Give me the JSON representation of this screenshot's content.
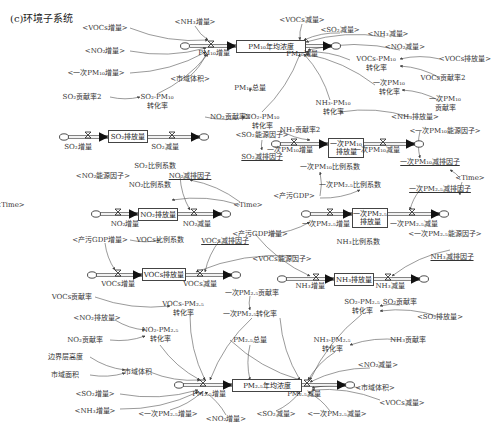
{
  "title": "(c)环境子系统",
  "stocks": [
    {
      "id": "pm10_conc",
      "label": "PM₁₀年均浓度",
      "x": 236,
      "y": 40,
      "w": 70,
      "h": 13
    },
    {
      "id": "so2_emit",
      "label": "SO₂排放量",
      "x": 108,
      "y": 130,
      "w": 40,
      "h": 13
    },
    {
      "id": "pm10_primary",
      "label": "一次PM₁₀\n排放量",
      "x": 328,
      "y": 138,
      "w": 36,
      "h": 20
    },
    {
      "id": "no2_emit",
      "label": "NO₂排放量",
      "x": 138,
      "y": 208,
      "w": 40,
      "h": 13
    },
    {
      "id": "pm25_primary",
      "label": "一次PM₂.₅\n排放量",
      "x": 352,
      "y": 208,
      "w": 36,
      "h": 20
    },
    {
      "id": "vocs_emit",
      "label": "VOCs排放量",
      "x": 142,
      "y": 268,
      "w": 44,
      "h": 13
    },
    {
      "id": "nh3_emit",
      "label": "NH₃排放量",
      "x": 334,
      "y": 273,
      "w": 40,
      "h": 13
    },
    {
      "id": "pm25_conc",
      "label": "PM₂.₅年均浓度",
      "x": 232,
      "y": 379,
      "w": 70,
      "h": 13
    }
  ],
  "labels": [
    {
      "t": "<VOCs增量>",
      "x": 105,
      "y": 28
    },
    {
      "t": "<NH₃增量>",
      "x": 195,
      "y": 22
    },
    {
      "t": "<VOCs减量>",
      "x": 302,
      "y": 20
    },
    {
      "t": "<SO₂减量>",
      "x": 340,
      "y": 30
    },
    {
      "t": "<NH₃减量>",
      "x": 388,
      "y": 34
    },
    {
      "t": "<NO₂增量>",
      "x": 105,
      "y": 51
    },
    {
      "t": "<NO₂减量>",
      "x": 405,
      "y": 47
    },
    {
      "t": "PM₁₀增量",
      "x": 214,
      "y": 53
    },
    {
      "t": "PM₁₀减量",
      "x": 302,
      "y": 54
    },
    {
      "t": "VOCs-PM₁₀",
      "x": 376,
      "y": 59
    },
    {
      "t": "转化率",
      "x": 376,
      "y": 68
    },
    {
      "t": "<VOCs排放量>",
      "x": 465,
      "y": 59
    },
    {
      "t": "VOCs贡献率2",
      "x": 443,
      "y": 78
    },
    {
      "t": "<一次PM₁₀增量>",
      "x": 96,
      "y": 73
    },
    {
      "t": "<市域体积>",
      "x": 190,
      "y": 79
    },
    {
      "t": "PM₁₀总量",
      "x": 250,
      "y": 88
    },
    {
      "t": "一次PM₁₀",
      "x": 389,
      "y": 83
    },
    {
      "t": "转化率",
      "x": 389,
      "y": 92
    },
    {
      "t": "一次PM₁₀",
      "x": 445,
      "y": 99
    },
    {
      "t": "贡献率",
      "x": 445,
      "y": 108
    },
    {
      "t": "SO₂贡献率2",
      "x": 82,
      "y": 97
    },
    {
      "t": "SO₂-PM₁₀",
      "x": 157,
      "y": 97
    },
    {
      "t": "转化率",
      "x": 157,
      "y": 106
    },
    {
      "t": "NH₃-PM₁₀",
      "x": 333,
      "y": 103
    },
    {
      "t": "转化率",
      "x": 333,
      "y": 112
    },
    {
      "t": "NO₂贡献率2",
      "x": 230,
      "y": 117
    },
    {
      "t": "NO₂-PM₁₀",
      "x": 262,
      "y": 117
    },
    {
      "t": "转化率",
      "x": 262,
      "y": 126
    },
    {
      "t": "<NH₃排放量>",
      "x": 415,
      "y": 117
    },
    {
      "t": "NH₃贡献率2",
      "x": 300,
      "y": 130
    },
    {
      "t": "<一次PM₁₀能源因子>",
      "x": 445,
      "y": 131
    },
    {
      "t": "<SO₂能源因子>",
      "x": 262,
      "y": 135
    },
    {
      "t": "SO₂增量",
      "x": 78,
      "y": 147
    },
    {
      "t": "SO₂减量",
      "x": 165,
      "y": 147
    },
    {
      "t": "一次PM₁₀增量",
      "x": 290,
      "y": 150
    },
    {
      "t": "一次PM₁₀减量",
      "x": 377,
      "y": 150
    },
    {
      "t": "SO₂减排因子",
      "x": 262,
      "y": 157,
      "u": true
    },
    {
      "t": "一次PM₁₀减排因子",
      "x": 430,
      "y": 162,
      "u": true
    },
    {
      "t": "SO₂比例系数",
      "x": 155,
      "y": 166
    },
    {
      "t": "一次PM₁₀比例系数",
      "x": 330,
      "y": 167
    },
    {
      "t": "<NO₂能源因子>",
      "x": 103,
      "y": 176
    },
    {
      "t": "NO₂减排因子",
      "x": 190,
      "y": 176,
      "u": true
    },
    {
      "t": "<Time>",
      "x": 470,
      "y": 178
    },
    {
      "t": "NO₂比例系数",
      "x": 150,
      "y": 185
    },
    {
      "t": "一次PM₂.₅比例系数",
      "x": 350,
      "y": 185
    },
    {
      "t": "<产污GDP>",
      "x": 294,
      "y": 196
    },
    {
      "t": "一次PM₂.₅减排因子",
      "x": 440,
      "y": 189,
      "u": true
    },
    {
      "t": "<Time>",
      "x": 248,
      "y": 205
    },
    {
      "t": "<Time>",
      "x": 10,
      "y": 205
    },
    {
      "t": "NO₂增量",
      "x": 125,
      "y": 224
    },
    {
      "t": "NO₂减量",
      "x": 197,
      "y": 224
    },
    {
      "t": "一次PM₂.₅增量",
      "x": 326,
      "y": 224
    },
    {
      "t": "一次PM₂.₅减量",
      "x": 414,
      "y": 224
    },
    {
      "t": "<产污GDP增量>",
      "x": 100,
      "y": 240
    },
    {
      "t": "<产污GDP增量>",
      "x": 260,
      "y": 234
    },
    {
      "t": "VOCs比例系数",
      "x": 160,
      "y": 240
    },
    {
      "t": "VOCs减排因子",
      "x": 225,
      "y": 241,
      "u": true
    },
    {
      "t": "NH₃比例系数",
      "x": 358,
      "y": 242
    },
    {
      "t": "<一次PM₂.₅能源因子>",
      "x": 445,
      "y": 234
    },
    {
      "t": "<VOCs能源因子>",
      "x": 282,
      "y": 259
    },
    {
      "t": "NH₃减排因子",
      "x": 452,
      "y": 257,
      "u": true
    },
    {
      "t": "VOCs增量",
      "x": 118,
      "y": 284
    },
    {
      "t": "VOCs减量",
      "x": 200,
      "y": 284
    },
    {
      "t": "NH₃增量",
      "x": 310,
      "y": 286
    },
    {
      "t": "NH₃减量",
      "x": 390,
      "y": 286
    },
    {
      "t": "VOCs贡献率",
      "x": 72,
      "y": 297
    },
    {
      "t": "一次PM₂.₅贡献率",
      "x": 252,
      "y": 293
    },
    {
      "t": "VOCs-PM₂.₅",
      "x": 183,
      "y": 304
    },
    {
      "t": "转化率",
      "x": 183,
      "y": 313
    },
    {
      "t": "SO₂-PM₂.₅",
      "x": 362,
      "y": 302
    },
    {
      "t": "转化率",
      "x": 362,
      "y": 311
    },
    {
      "t": "SO₂贡献率",
      "x": 400,
      "y": 302
    },
    {
      "t": "一次PM₂.₅转化率",
      "x": 250,
      "y": 314
    },
    {
      "t": "<SO₂排放量>",
      "x": 440,
      "y": 317
    },
    {
      "t": "<NO₂排放量>",
      "x": 97,
      "y": 318
    },
    {
      "t": "NO₂-PM₂.₅",
      "x": 160,
      "y": 330
    },
    {
      "t": "转化率",
      "x": 160,
      "y": 339
    },
    {
      "t": "NO₂贡献率",
      "x": 85,
      "y": 340
    },
    {
      "t": "PM₂.₅总量",
      "x": 250,
      "y": 340
    },
    {
      "t": "NH₃-PM₂.₅",
      "x": 332,
      "y": 340
    },
    {
      "t": "转化率",
      "x": 332,
      "y": 349
    },
    {
      "t": "NH₃贡献率",
      "x": 408,
      "y": 340
    },
    {
      "t": "边界层高度",
      "x": 65,
      "y": 357
    },
    {
      "t": "<NO₂减量>",
      "x": 378,
      "y": 365
    },
    {
      "t": "市域体积",
      "x": 138,
      "y": 372
    },
    {
      "t": "市域面积",
      "x": 65,
      "y": 375
    },
    {
      "t": "PM₂.₅增量",
      "x": 209,
      "y": 394
    },
    {
      "t": "PM₂.₅减量",
      "x": 304,
      "y": 394
    },
    {
      "t": "<市域体积>",
      "x": 375,
      "y": 388
    },
    {
      "t": "<SO₂增量>",
      "x": 95,
      "y": 394
    },
    {
      "t": "<VOCs减量>",
      "x": 402,
      "y": 403
    },
    {
      "t": "<NH₃增量>",
      "x": 95,
      "y": 411
    },
    {
      "t": "<一次PM₂.₅增量>",
      "x": 168,
      "y": 414
    },
    {
      "t": "<NO₂增量>",
      "x": 226,
      "y": 419
    },
    {
      "t": "<SO₂减量>",
      "x": 276,
      "y": 414
    },
    {
      "t": "<一次PM₂.₅减量>",
      "x": 337,
      "y": 414
    }
  ],
  "flows": [
    {
      "x1": 190,
      "y1": 46,
      "x2": 236,
      "y2": 46
    },
    {
      "x1": 306,
      "y1": 46,
      "x2": 332,
      "y2": 46
    },
    {
      "x1": 68,
      "y1": 137,
      "x2": 108,
      "y2": 137
    },
    {
      "x1": 148,
      "y1": 137,
      "x2": 200,
      "y2": 137
    },
    {
      "x1": 280,
      "y1": 144,
      "x2": 328,
      "y2": 144
    },
    {
      "x1": 364,
      "y1": 144,
      "x2": 415,
      "y2": 144
    },
    {
      "x1": 100,
      "y1": 214,
      "x2": 138,
      "y2": 214
    },
    {
      "x1": 178,
      "y1": 214,
      "x2": 222,
      "y2": 214
    },
    {
      "x1": 310,
      "y1": 214,
      "x2": 352,
      "y2": 214
    },
    {
      "x1": 388,
      "y1": 214,
      "x2": 440,
      "y2": 214
    },
    {
      "x1": 96,
      "y1": 275,
      "x2": 142,
      "y2": 275
    },
    {
      "x1": 186,
      "y1": 275,
      "x2": 232,
      "y2": 275
    },
    {
      "x1": 286,
      "y1": 279,
      "x2": 334,
      "y2": 279
    },
    {
      "x1": 374,
      "y1": 279,
      "x2": 420,
      "y2": 279
    },
    {
      "x1": 183,
      "y1": 385,
      "x2": 232,
      "y2": 385
    },
    {
      "x1": 302,
      "y1": 385,
      "x2": 346,
      "y2": 385
    }
  ],
  "valves": [
    {
      "x": 211,
      "y": 46
    },
    {
      "x": 300,
      "y": 46
    },
    {
      "x": 88,
      "y": 137
    },
    {
      "x": 172,
      "y": 137
    },
    {
      "x": 294,
      "y": 144
    },
    {
      "x": 383,
      "y": 144
    },
    {
      "x": 118,
      "y": 214
    },
    {
      "x": 194,
      "y": 214
    },
    {
      "x": 330,
      "y": 214
    },
    {
      "x": 412,
      "y": 214
    },
    {
      "x": 118,
      "y": 275
    },
    {
      "x": 200,
      "y": 275
    },
    {
      "x": 316,
      "y": 279
    },
    {
      "x": 388,
      "y": 279
    },
    {
      "x": 203,
      "y": 385
    },
    {
      "x": 307,
      "y": 385
    }
  ],
  "clouds": [
    {
      "x": 185,
      "y": 46
    },
    {
      "x": 336,
      "y": 46
    },
    {
      "x": 64,
      "y": 137
    },
    {
      "x": 204,
      "y": 137
    },
    {
      "x": 276,
      "y": 144
    },
    {
      "x": 419,
      "y": 144
    },
    {
      "x": 96,
      "y": 214
    },
    {
      "x": 226,
      "y": 214
    },
    {
      "x": 306,
      "y": 214
    },
    {
      "x": 444,
      "y": 214
    },
    {
      "x": 92,
      "y": 275
    },
    {
      "x": 236,
      "y": 275
    },
    {
      "x": 282,
      "y": 279
    },
    {
      "x": 424,
      "y": 279
    },
    {
      "x": 179,
      "y": 385
    },
    {
      "x": 350,
      "y": 385
    }
  ],
  "links": [
    [
      130,
      28,
      208,
      40
    ],
    [
      195,
      26,
      208,
      40
    ],
    [
      130,
      51,
      206,
      48
    ],
    [
      130,
      73,
      206,
      52
    ],
    [
      190,
      76,
      206,
      54
    ],
    [
      157,
      94,
      208,
      54
    ],
    [
      302,
      24,
      300,
      40
    ],
    [
      340,
      33,
      304,
      40
    ],
    [
      385,
      37,
      306,
      42
    ],
    [
      400,
      50,
      308,
      50
    ],
    [
      350,
      60,
      306,
      52
    ],
    [
      375,
      85,
      306,
      54
    ],
    [
      330,
      100,
      304,
      54
    ],
    [
      262,
      112,
      300,
      54
    ],
    [
      440,
      59,
      400,
      59
    ],
    [
      440,
      78,
      400,
      66
    ],
    [
      440,
      101,
      402,
      90
    ],
    [
      410,
      117,
      340,
      112
    ],
    [
      110,
      97,
      140,
      97
    ],
    [
      250,
      117,
      250,
      117
    ],
    [
      205,
      117,
      245,
      117
    ],
    [
      280,
      130,
      310,
      140
    ],
    [
      250,
      92,
      250,
      88
    ],
    [
      262,
      140,
      262,
      150
    ],
    [
      420,
      131,
      420,
      158
    ],
    [
      460,
      178,
      450,
      170
    ],
    [
      462,
      182,
      460,
      195
    ],
    [
      180,
      176,
      190,
      210
    ],
    [
      240,
      202,
      190,
      180
    ],
    [
      240,
      205,
      172,
      200
    ],
    [
      320,
      196,
      320,
      172
    ],
    [
      320,
      198,
      360,
      190
    ],
    [
      270,
      234,
      310,
      222
    ],
    [
      420,
      190,
      410,
      210
    ],
    [
      220,
      240,
      205,
      272
    ],
    [
      130,
      240,
      160,
      240
    ],
    [
      295,
      256,
      196,
      272
    ],
    [
      105,
      243,
      115,
      270
    ],
    [
      255,
      234,
      310,
      276
    ],
    [
      450,
      250,
      392,
      276
    ],
    [
      95,
      297,
      170,
      306
    ],
    [
      250,
      296,
      250,
      310
    ],
    [
      400,
      305,
      380,
      306
    ],
    [
      440,
      317,
      380,
      311
    ],
    [
      115,
      320,
      145,
      330
    ],
    [
      110,
      340,
      145,
      336
    ],
    [
      400,
      340,
      350,
      345
    ],
    [
      90,
      357,
      125,
      370
    ],
    [
      90,
      375,
      125,
      373
    ],
    [
      150,
      372,
      200,
      380
    ],
    [
      120,
      394,
      198,
      390
    ],
    [
      120,
      409,
      198,
      392
    ],
    [
      170,
      410,
      202,
      392
    ],
    [
      226,
      415,
      205,
      392
    ],
    [
      276,
      411,
      300,
      392
    ],
    [
      330,
      411,
      308,
      392
    ],
    [
      370,
      368,
      310,
      382
    ],
    [
      360,
      388,
      312,
      388
    ],
    [
      380,
      400,
      312,
      390
    ],
    [
      190,
      315,
      205,
      380
    ],
    [
      252,
      318,
      210,
      380
    ],
    [
      335,
      352,
      308,
      380
    ],
    [
      362,
      314,
      310,
      380
    ],
    [
      250,
      345,
      250,
      380
    ],
    [
      230,
      340,
      300,
      380
    ],
    [
      160,
      345,
      200,
      380
    ],
    [
      280,
      318,
      300,
      380
    ]
  ]
}
